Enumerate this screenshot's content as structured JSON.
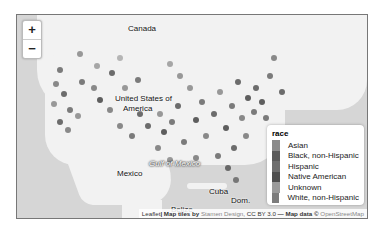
{
  "map": {
    "labels": {
      "canada": "Canada",
      "usa": "United States of\nAmerica",
      "usa_line1": "United States of",
      "usa_line2": "America",
      "mexico": "Mexico",
      "gulf": "Gulf of Mexico",
      "cuba": "Cuba",
      "dom": "Dom.",
      "belize": "Belize"
    },
    "zoom_in": "+",
    "zoom_out": "−"
  },
  "legend": {
    "title": "race",
    "items": [
      {
        "label": "Asian",
        "color": "#8a8a8a"
      },
      {
        "label": "Black, non-Hispanic",
        "color": "#5a5a5a"
      },
      {
        "label": "Hispanic",
        "color": "#6e6e6e"
      },
      {
        "label": "Native American",
        "color": "#4e4e4e"
      },
      {
        "label": "Unknown",
        "color": "#9a9a9a"
      },
      {
        "label": "White, non-Hispanic",
        "color": "#7c7c7c"
      }
    ]
  },
  "attribution": {
    "leaflet": "Leaflet",
    "tiles_prefix": "| Map tiles by ",
    "stamen": "Stamen Design",
    "license": ", CC BY 3.0",
    "data_prefix": " — Map data © ",
    "osm": "OpenStreetMap"
  }
}
